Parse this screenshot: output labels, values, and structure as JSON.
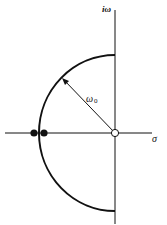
{
  "diagram": {
    "axes": {
      "imaginary_label": "iω",
      "real_label": "σ"
    },
    "radius_label": "ω",
    "radius_subscript": "0",
    "elements": {
      "zero": "open circle at origin",
      "poles": "two filled dots on negative real axis",
      "arc": "semicircle of radius ω0 in left half-plane"
    },
    "colors": {
      "line": "#111111",
      "background": "#ffffff"
    }
  }
}
